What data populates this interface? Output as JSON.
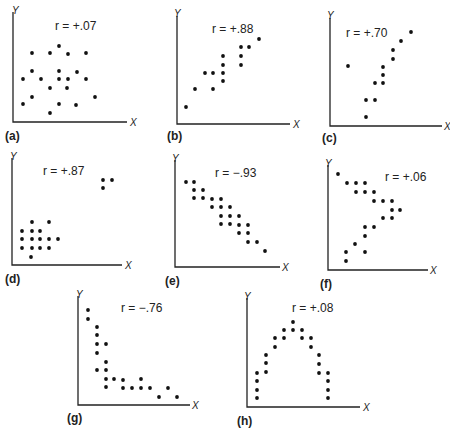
{
  "chart_data": [
    {
      "id": "a",
      "type": "scatter",
      "panel_label": "(a)",
      "annotation": "r = +.07",
      "r": 0.07,
      "xlabel": "X",
      "ylabel": "Y",
      "grid": false,
      "origin": [
        13,
        122
      ],
      "x_end": 127,
      "y_top": 12,
      "annotation_pos": [
        55,
        30
      ],
      "panel_label_pos": [
        5,
        140
      ],
      "xlabel_pos": [
        130,
        126
      ],
      "ylabel_pos": [
        12,
        14
      ],
      "points": [
        [
          59,
          46
        ],
        [
          32,
          53
        ],
        [
          50,
          53
        ],
        [
          68,
          54
        ],
        [
          86,
          53
        ],
        [
          32,
          71
        ],
        [
          59,
          71
        ],
        [
          77,
          72
        ],
        [
          23,
          79
        ],
        [
          41,
          79
        ],
        [
          59,
          79
        ],
        [
          68,
          79
        ],
        [
          86,
          79
        ],
        [
          50,
          88
        ],
        [
          67,
          88
        ],
        [
          32,
          97
        ],
        [
          95,
          97
        ],
        [
          23,
          104
        ],
        [
          59,
          104
        ],
        [
          76,
          105
        ],
        [
          50,
          113
        ]
      ]
    },
    {
      "id": "b",
      "type": "scatter",
      "panel_label": "(b)",
      "annotation": "r = +.88",
      "r": 0.88,
      "xlabel": "X",
      "ylabel": "Y",
      "grid": false,
      "origin": [
        177,
        124
      ],
      "x_end": 290,
      "y_top": 16,
      "annotation_pos": [
        212,
        33
      ],
      "panel_label_pos": [
        167,
        140
      ],
      "xlabel_pos": [
        293,
        128
      ],
      "ylabel_pos": [
        174,
        17
      ],
      "points": [
        [
          186,
          107
        ],
        [
          195,
          89
        ],
        [
          205,
          73
        ],
        [
          213,
          73
        ],
        [
          213,
          89
        ],
        [
          223,
          56
        ],
        [
          223,
          65
        ],
        [
          223,
          73
        ],
        [
          223,
          81
        ],
        [
          241,
          47
        ],
        [
          249,
          47
        ],
        [
          241,
          56
        ],
        [
          241,
          65
        ],
        [
          259,
          39
        ]
      ]
    },
    {
      "id": "c",
      "type": "scatter",
      "panel_label": "(c)",
      "annotation": "r = +.70",
      "r": 0.7,
      "xlabel": "X",
      "ylabel": "Y",
      "grid": false,
      "origin": [
        330,
        126
      ],
      "x_end": 442,
      "y_top": 18,
      "annotation_pos": [
        346,
        37
      ],
      "panel_label_pos": [
        322,
        142
      ],
      "xlabel_pos": [
        444,
        130
      ],
      "ylabel_pos": [
        327,
        19
      ],
      "points": [
        [
          348,
          66
        ],
        [
          366,
          117
        ],
        [
          366,
          100
        ],
        [
          375,
          100
        ],
        [
          375,
          83
        ],
        [
          383,
          83
        ],
        [
          383,
          75
        ],
        [
          383,
          67
        ],
        [
          393,
          59
        ],
        [
          393,
          50
        ],
        [
          401,
          41
        ],
        [
          411,
          32
        ]
      ]
    },
    {
      "id": "d",
      "type": "scatter",
      "panel_label": "(d)",
      "annotation": "r = +.87",
      "r": 0.87,
      "xlabel": "X",
      "ylabel": "Y",
      "grid": false,
      "origin": [
        12,
        265
      ],
      "x_end": 122,
      "y_top": 158,
      "annotation_pos": [
        43,
        175
      ],
      "panel_label_pos": [
        5,
        283
      ],
      "xlabel_pos": [
        125,
        269
      ],
      "ylabel_pos": [
        10,
        160
      ],
      "points": [
        [
          103,
          180
        ],
        [
          112,
          180
        ],
        [
          103,
          188
        ],
        [
          32,
          222
        ],
        [
          49,
          222
        ],
        [
          22,
          231
        ],
        [
          32,
          231
        ],
        [
          40,
          231
        ],
        [
          22,
          239
        ],
        [
          32,
          239
        ],
        [
          40,
          239
        ],
        [
          49,
          239
        ],
        [
          58,
          239
        ],
        [
          22,
          248
        ],
        [
          32,
          248
        ],
        [
          40,
          248
        ],
        [
          49,
          248
        ],
        [
          31,
          257
        ]
      ]
    },
    {
      "id": "e",
      "type": "scatter",
      "panel_label": "(e)",
      "annotation": "r = −.93",
      "r": -0.93,
      "xlabel": "X",
      "ylabel": "Y",
      "grid": false,
      "origin": [
        175,
        267
      ],
      "x_end": 280,
      "y_top": 160,
      "annotation_pos": [
        215,
        177
      ],
      "panel_label_pos": [
        165,
        285
      ],
      "xlabel_pos": [
        282,
        271
      ],
      "ylabel_pos": [
        172,
        162
      ],
      "points": [
        [
          186,
          182
        ],
        [
          194,
          182
        ],
        [
          194,
          190
        ],
        [
          203,
          190
        ],
        [
          194,
          198
        ],
        [
          203,
          198
        ],
        [
          212,
          199
        ],
        [
          221,
          199
        ],
        [
          212,
          207
        ],
        [
          221,
          207
        ],
        [
          230,
          207
        ],
        [
          221,
          216
        ],
        [
          230,
          216
        ],
        [
          239,
          216
        ],
        [
          221,
          224
        ],
        [
          230,
          224
        ],
        [
          239,
          225
        ],
        [
          248,
          225
        ],
        [
          239,
          233
        ],
        [
          248,
          233
        ],
        [
          248,
          242
        ],
        [
          257,
          242
        ],
        [
          265,
          251
        ]
      ]
    },
    {
      "id": "f",
      "type": "scatter",
      "panel_label": "(f)",
      "annotation": "r = +.06",
      "r": 0.06,
      "xlabel": "X",
      "ylabel": "Y",
      "grid": false,
      "origin": [
        328,
        270
      ],
      "x_end": 428,
      "y_top": 165,
      "annotation_pos": [
        385,
        181
      ],
      "panel_label_pos": [
        320,
        288
      ],
      "xlabel_pos": [
        430,
        274
      ],
      "ylabel_pos": [
        325,
        167
      ],
      "points": [
        [
          338,
          174
        ],
        [
          347,
          183
        ],
        [
          356,
          183
        ],
        [
          365,
          183
        ],
        [
          356,
          192
        ],
        [
          365,
          192
        ],
        [
          374,
          192
        ],
        [
          374,
          201
        ],
        [
          383,
          201
        ],
        [
          392,
          201
        ],
        [
          392,
          210
        ],
        [
          400,
          210
        ],
        [
          383,
          218
        ],
        [
          392,
          218
        ],
        [
          365,
          227
        ],
        [
          374,
          227
        ],
        [
          365,
          236
        ],
        [
          355,
          244
        ],
        [
          346,
          252
        ],
        [
          365,
          252
        ],
        [
          346,
          261
        ]
      ]
    },
    {
      "id": "g",
      "type": "scatter",
      "panel_label": "(g)",
      "annotation": "r = −.76",
      "r": -0.76,
      "xlabel": "X",
      "ylabel": "Y",
      "grid": false,
      "origin": [
        78,
        405
      ],
      "x_end": 190,
      "y_top": 296,
      "annotation_pos": [
        121,
        312
      ],
      "panel_label_pos": [
        67,
        422
      ],
      "xlabel_pos": [
        192,
        409
      ],
      "ylabel_pos": [
        76,
        298
      ],
      "points": [
        [
          88,
          310
        ],
        [
          88,
          319
        ],
        [
          97,
          327
        ],
        [
          97,
          335
        ],
        [
          97,
          344
        ],
        [
          106,
          344
        ],
        [
          97,
          353
        ],
        [
          106,
          362
        ],
        [
          97,
          370
        ],
        [
          106,
          370
        ],
        [
          106,
          379
        ],
        [
          114,
          379
        ],
        [
          123,
          380
        ],
        [
          141,
          379
        ],
        [
          106,
          387
        ],
        [
          123,
          388
        ],
        [
          132,
          388
        ],
        [
          141,
          388
        ],
        [
          150,
          388
        ],
        [
          168,
          388
        ],
        [
          159,
          397
        ],
        [
          177,
          397
        ]
      ]
    },
    {
      "id": "h",
      "type": "scatter",
      "panel_label": "(h)",
      "annotation": "r = +.08",
      "r": 0.08,
      "xlabel": "X",
      "ylabel": "Y",
      "grid": false,
      "origin": [
        247,
        407
      ],
      "x_end": 360,
      "y_top": 298,
      "annotation_pos": [
        292,
        312
      ],
      "panel_label_pos": [
        237,
        425
      ],
      "xlabel_pos": [
        363,
        411
      ],
      "ylabel_pos": [
        244,
        300
      ],
      "points": [
        [
          257,
          373
        ],
        [
          257,
          381
        ],
        [
          257,
          390
        ],
        [
          257,
          398
        ],
        [
          266,
          355
        ],
        [
          266,
          363
        ],
        [
          266,
          372
        ],
        [
          275,
          338
        ],
        [
          275,
          347
        ],
        [
          284,
          330
        ],
        [
          284,
          338
        ],
        [
          293,
          322
        ],
        [
          293,
          330
        ],
        [
          302,
          330
        ],
        [
          302,
          338
        ],
        [
          311,
          338
        ],
        [
          311,
          347
        ],
        [
          319,
          355
        ],
        [
          319,
          364
        ],
        [
          319,
          373
        ],
        [
          328,
          373
        ],
        [
          328,
          381
        ],
        [
          328,
          390
        ],
        [
          328,
          398
        ]
      ]
    }
  ]
}
